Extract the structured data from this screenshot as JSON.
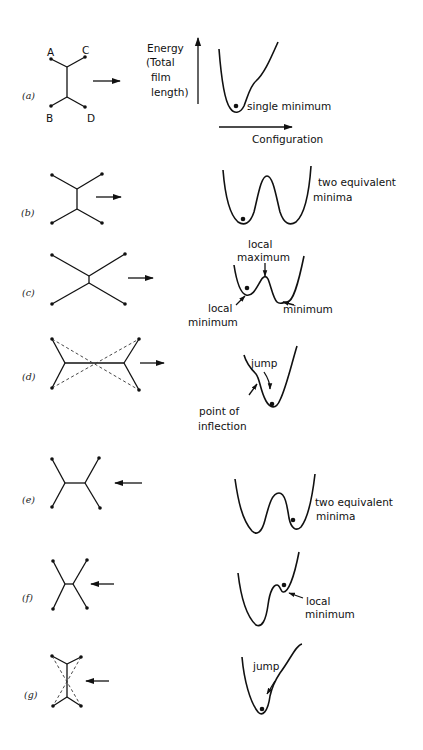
{
  "axes": {
    "ylabel_lines": [
      "Energy",
      "(Total",
      "film",
      "length)"
    ],
    "xlabel": "Configuration"
  },
  "panels": [
    {
      "id": "a",
      "label": "(a)",
      "arrow": "right",
      "vertex_labels": [
        "A",
        "C",
        "B",
        "D"
      ],
      "annotations": [
        "single minimum"
      ]
    },
    {
      "id": "b",
      "label": "(b)",
      "arrow": "right",
      "annotations": [
        "two equivalent",
        "minima"
      ]
    },
    {
      "id": "c",
      "label": "(c)",
      "arrow": "right",
      "annotations": [
        "local",
        "maximum",
        "local",
        "minimum",
        "minimum"
      ]
    },
    {
      "id": "d",
      "label": "(d)",
      "arrow": "right",
      "annotations": [
        "jump",
        "point of",
        "inflection"
      ]
    },
    {
      "id": "e",
      "label": "(e)",
      "arrow": "left",
      "annotations": [
        "two equivalent",
        "minima"
      ]
    },
    {
      "id": "f",
      "label": "(f)",
      "arrow": "left",
      "annotations": [
        "local",
        "minimum"
      ]
    },
    {
      "id": "g",
      "label": "(g)",
      "arrow": "left",
      "annotations": [
        "jump"
      ]
    }
  ]
}
